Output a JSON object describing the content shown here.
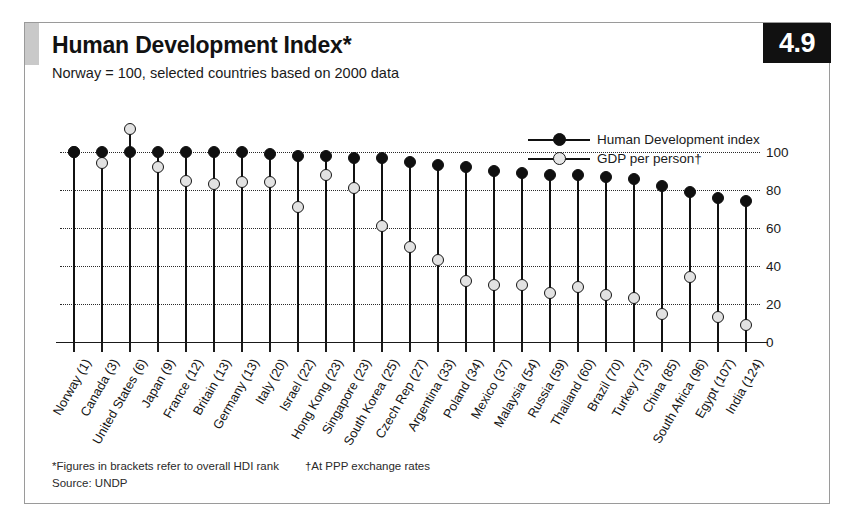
{
  "figure": {
    "badge_number": "4.9",
    "title": "Human Development Index*",
    "subtitle": "Norway = 100, selected countries based on 2000 data",
    "footnote_hdi": "*Figures in brackets refer to overall HDI rank",
    "footnote_ppp": "†At PPP exchange rates",
    "source": "Source: UNDP"
  },
  "legend": {
    "position": "top-right-inside",
    "entries": [
      {
        "label": "Human Development index",
        "marker": "filled-circle",
        "color": "#101010"
      },
      {
        "label": "GDP per person†",
        "marker": "open-circle",
        "color": "#e2e2e2"
      }
    ]
  },
  "colors": {
    "hdi_marker": "#101010",
    "gdp_marker": "#e2e2e2",
    "stem": "#111111",
    "gridline": "#2b2b2b",
    "badge_background": "#111111",
    "corner_accent": "#c9c9c9",
    "frame": "#9a9a9a"
  },
  "chart_data": {
    "type": "scatter",
    "title": "Human Development Index*",
    "subtitle": "Norway = 100, selected countries based on 2000 data",
    "xlabel": "",
    "ylabel": "",
    "ylim": [
      0,
      112
    ],
    "yticks": [
      0,
      20,
      40,
      60,
      80,
      100
    ],
    "ytick_labels": [
      "0",
      "20",
      "40",
      "60",
      "80",
      "100"
    ],
    "grid": true,
    "axis_side": "right",
    "categories": [
      "Norway (1)",
      "Canada (3)",
      "United States (6)",
      "Japan (9)",
      "France (12)",
      "Britain (13)",
      "Germany (13)",
      "Italy (20)",
      "Israel (22)",
      "Hong Kong (23)",
      "Singapore (23)",
      "South Korea (25)",
      "Czech Rep (27)",
      "Argentina (33)",
      "Poland (34)",
      "Mexico (37)",
      "Malaysia (54)",
      "Russia (59)",
      "Thailand (60)",
      "Brazil (70)",
      "Turkey (73)",
      "China (85)",
      "South Africa (96)",
      "Egypt (107)",
      "India (124)"
    ],
    "series": [
      {
        "name": "Human Development index",
        "marker": "filled-circle",
        "values": [
          100,
          100,
          100,
          100,
          100,
          100,
          100,
          99,
          98,
          98,
          97,
          97,
          95,
          93,
          92,
          90,
          89,
          88,
          88,
          87,
          86,
          82,
          79,
          76,
          74
        ]
      },
      {
        "name": "GDP per person†",
        "marker": "open-circle",
        "values": [
          100,
          94,
          112,
          92,
          85,
          83,
          84,
          84,
          71,
          88,
          81,
          61,
          50,
          43,
          32,
          30,
          30,
          26,
          29,
          25,
          23,
          15,
          34,
          13,
          9
        ]
      }
    ]
  },
  "y_axis": {
    "ticks": [
      {
        "value": 100,
        "label": "100"
      },
      {
        "value": 80,
        "label": "80"
      },
      {
        "value": 60,
        "label": "60"
      },
      {
        "value": 40,
        "label": "40"
      },
      {
        "value": 20,
        "label": "20"
      },
      {
        "value": 0,
        "label": "0"
      }
    ]
  }
}
